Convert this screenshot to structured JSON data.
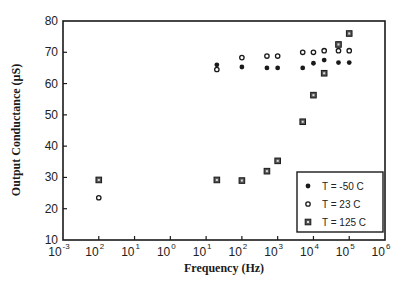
{
  "chart_data": {
    "type": "scatter",
    "title": "",
    "xlabel": "Frequency  (Hz)",
    "ylabel": "Output Conductance  (µS)",
    "xscale": "log",
    "xlim_exponent": [
      -3,
      6
    ],
    "ylim": [
      10,
      80
    ],
    "x_tick_labels": [
      {
        "base": "10",
        "exp": "-3"
      },
      {
        "base": "10",
        "exp": "2"
      },
      {
        "base": "10",
        "exp": "1"
      },
      {
        "base": "10",
        "exp": "0"
      },
      {
        "base": "10",
        "exp": "1"
      },
      {
        "base": "10",
        "exp": "2"
      },
      {
        "base": "10",
        "exp": "3"
      },
      {
        "base": "10",
        "exp": "4"
      },
      {
        "base": "10",
        "exp": "5"
      },
      {
        "base": "10",
        "exp": "6"
      }
    ],
    "y_ticks": [
      10,
      20,
      30,
      40,
      50,
      60,
      70,
      80
    ],
    "grid": false,
    "legend_position": "lower right",
    "series": [
      {
        "name": "T = -50 C",
        "marker": "filled-circle",
        "points": [
          {
            "log10x": 1.3,
            "y": 66
          },
          {
            "log10x": 2.0,
            "y": 65.3
          },
          {
            "log10x": 2.7,
            "y": 65
          },
          {
            "log10x": 3.0,
            "y": 65
          },
          {
            "log10x": 3.7,
            "y": 65
          },
          {
            "log10x": 4.0,
            "y": 66.5
          },
          {
            "log10x": 4.3,
            "y": 67.5
          },
          {
            "log10x": 4.7,
            "y": 66.7
          },
          {
            "log10x": 5.0,
            "y": 66.7
          }
        ]
      },
      {
        "name": "T =  23 C",
        "marker": "open-circle",
        "points": [
          {
            "log10x": -2.0,
            "y": 23.5
          },
          {
            "log10x": 1.3,
            "y": 64.5
          },
          {
            "log10x": 2.0,
            "y": 68.3
          },
          {
            "log10x": 2.7,
            "y": 68.8
          },
          {
            "log10x": 3.0,
            "y": 68.8
          },
          {
            "log10x": 3.7,
            "y": 70
          },
          {
            "log10x": 4.0,
            "y": 70
          },
          {
            "log10x": 4.3,
            "y": 70.5
          },
          {
            "log10x": 4.7,
            "y": 70.5
          },
          {
            "log10x": 5.0,
            "y": 70.5
          }
        ]
      },
      {
        "name": "T = 125 C",
        "marker": "square",
        "points": [
          {
            "log10x": -2.0,
            "y": 29.2
          },
          {
            "log10x": 1.3,
            "y": 29.2
          },
          {
            "log10x": 2.0,
            "y": 29
          },
          {
            "log10x": 2.7,
            "y": 32
          },
          {
            "log10x": 3.0,
            "y": 35.3
          },
          {
            "log10x": 3.7,
            "y": 47.8
          },
          {
            "log10x": 4.0,
            "y": 56.3
          },
          {
            "log10x": 4.3,
            "y": 63.3
          },
          {
            "log10x": 4.7,
            "y": 72.5
          },
          {
            "log10x": 5.0,
            "y": 76
          }
        ]
      }
    ]
  },
  "legend": {
    "items": [
      {
        "label": "T = -50 C",
        "marker": "filled-circle"
      },
      {
        "label": "T =  23 C",
        "marker": "open-circle"
      },
      {
        "label": "T = 125 C",
        "marker": "square"
      }
    ]
  },
  "colors": {
    "ink": "#1a1a1a",
    "background": "#ffffff"
  }
}
